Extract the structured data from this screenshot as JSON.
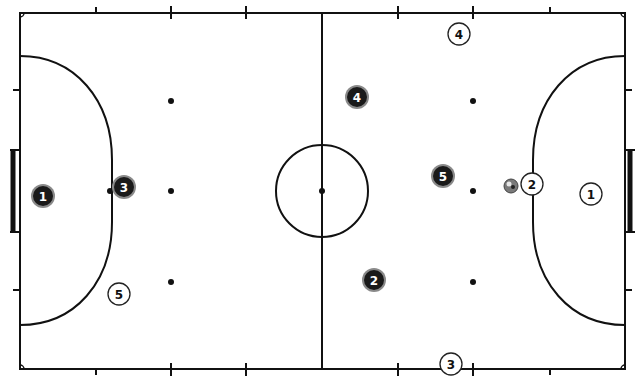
{
  "diagram": {
    "colors": {
      "background": "#ffffff",
      "lines": "#111111",
      "dark_team_fill": "#1a1a1a",
      "dark_team_ring": "#8a8a8a",
      "dark_team_text": "#ffffff",
      "light_team_fill": "#ffffff",
      "light_team_stroke": "#222222",
      "light_team_text": "#111111"
    },
    "court": {
      "left": 20,
      "right": 625,
      "top": 13,
      "bottom": 369,
      "center_x": 322,
      "center_y": 191,
      "center_circle_radius": 46
    },
    "dark_team": [
      {
        "number": "1",
        "x": 43,
        "y": 196
      },
      {
        "number": "3",
        "x": 124,
        "y": 187
      },
      {
        "number": "4",
        "x": 357,
        "y": 97
      },
      {
        "number": "5",
        "x": 443,
        "y": 176
      },
      {
        "number": "2",
        "x": 374,
        "y": 280
      }
    ],
    "light_team": [
      {
        "number": "4",
        "x": 459,
        "y": 34
      },
      {
        "number": "2",
        "x": 532,
        "y": 184
      },
      {
        "number": "1",
        "x": 591,
        "y": 194
      },
      {
        "number": "5",
        "x": 119,
        "y": 294
      },
      {
        "number": "3",
        "x": 451,
        "y": 364
      }
    ],
    "ball": {
      "x": 511,
      "y": 186
    }
  }
}
